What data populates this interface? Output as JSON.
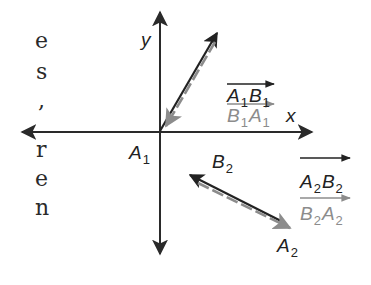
{
  "figure": {
    "type": "vector diagram",
    "colors": {
      "axis": "#2a2a2a",
      "vector_dark": "#222222",
      "vector_gray": "#8c8c8c",
      "background": "#ffffff"
    },
    "axes": {
      "x_label": "x",
      "y_label": "y",
      "origin_label": "A",
      "origin_label_sub": "1"
    },
    "vector_pair_1": {
      "forward": {
        "main": "A",
        "sub1": "1",
        "main2": "B",
        "sub2": "1"
      },
      "reverse": {
        "main": "B",
        "sub1": "1",
        "main2": "A",
        "sub2": "1"
      }
    },
    "vector_pair_2": {
      "forward": {
        "main": "A",
        "sub1": "2",
        "main2": "B",
        "sub2": "2"
      },
      "reverse": {
        "main": "B",
        "sub1": "2",
        "main2": "A",
        "sub2": "2"
      },
      "point_b": {
        "main": "B",
        "sub": "2"
      },
      "point_a": {
        "main": "A",
        "sub": "2"
      }
    }
  },
  "left_text_fragments": [
    "e",
    "s",
    ",",
    "r",
    "e",
    "n"
  ]
}
